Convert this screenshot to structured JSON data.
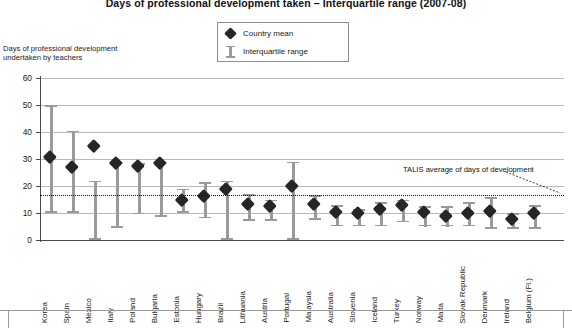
{
  "chart_data": {
    "type": "bar",
    "title": "Days of professional development taken – Interquartile range (2007-08)",
    "ylabel": "Days of professional development undertaken by teachers",
    "xlabel": "",
    "ylim": [
      0,
      60
    ],
    "yticks": [
      0,
      10,
      20,
      30,
      40,
      50,
      60
    ],
    "grid": true,
    "legend_position": "top-center",
    "legend": [
      {
        "key": "country-mean",
        "label": "Country mean",
        "marker": "diamond",
        "color": "#262626"
      },
      {
        "key": "interquartile-range",
        "label": "Interquartile range",
        "marker": "bar",
        "color": "#9a9a9a"
      }
    ],
    "annotations": [
      {
        "name": "talis-average",
        "text": "TALIS average of days of development",
        "value": 16.5
      }
    ],
    "categories": [
      "Korea",
      "Spain",
      "Mexico",
      "Italy",
      "Poland",
      "Bulgaria",
      "Estonia",
      "Hungary",
      "Brazil",
      "Lithuania",
      "Austria",
      "Portugal",
      "Malaysia",
      "Australia",
      "Slovenia",
      "Iceland",
      "Turkey",
      "Norway",
      "Malta",
      "Slovak Republic",
      "Denmark",
      "Ireland",
      "Belgium (Fl.)"
    ],
    "series": [
      {
        "name": "Country mean",
        "values": [
          31,
          27,
          35,
          28.5,
          27.5,
          28.5,
          15,
          16.5,
          19,
          13.5,
          12.5,
          20,
          13.5,
          10.5,
          10,
          11.5,
          13,
          10.5,
          9,
          10,
          11,
          8,
          10
        ]
      },
      {
        "name": "Interquartile range low",
        "values": [
          10,
          10,
          0,
          4.5,
          9.5,
          8.5,
          10,
          8,
          0,
          7,
          7,
          0,
          7.5,
          5,
          5,
          5,
          6.5,
          5,
          5,
          5,
          4,
          4,
          4
        ]
      },
      {
        "name": "Interquartile range high",
        "values": [
          50,
          40.5,
          22,
          29,
          28.5,
          29,
          19,
          21.5,
          22,
          17,
          15,
          29,
          16.5,
          13,
          11.5,
          14,
          15,
          12.5,
          12.5,
          14,
          16,
          10,
          13
        ]
      }
    ]
  }
}
